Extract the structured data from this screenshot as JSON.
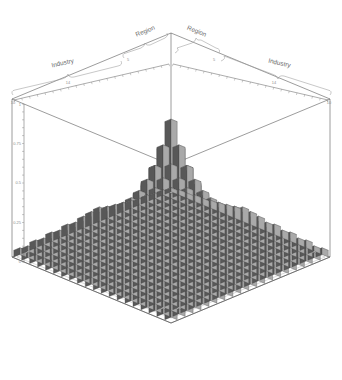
{
  "chart_data": {
    "type": "bar",
    "subtype": "3d-bar-cloud",
    "title": "",
    "xlabel": "Industry",
    "ylabel": "Region",
    "zlabel": "",
    "ylim": [
      0,
      1
    ],
    "z_ticks": [
      "0",
      "0.25",
      "0.5",
      "0.75",
      "1"
    ],
    "grid": false,
    "legend": "none",
    "projection": "isometric",
    "axes": {
      "left_front": {
        "outer_group": "Industry",
        "inner_group": "Region",
        "outer_ticks": [
          "10",
          "14"
        ],
        "inner_ticks": [
          "5"
        ]
      },
      "right_front": {
        "outer_group": "Industry",
        "inner_group": "Region",
        "outer_ticks": [
          "14",
          "10"
        ],
        "inner_ticks": [
          "5"
        ]
      }
    },
    "grid_size": {
      "rows": 20,
      "cols": 20
    },
    "peak": {
      "row": 10,
      "col": 10,
      "value": 1.0,
      "note": "central spire"
    },
    "values": [
      [
        0.05,
        0.04,
        0.07,
        0.05,
        0.09,
        0.06,
        0.12,
        0.08,
        0.1,
        0.14,
        0.18,
        0.11,
        0.09,
        0.07,
        0.12,
        0.06,
        0.05,
        0.08,
        0.04,
        0.05
      ],
      [
        0.04,
        0.06,
        0.05,
        0.08,
        0.07,
        0.11,
        0.09,
        0.14,
        0.12,
        0.17,
        0.2,
        0.13,
        0.11,
        0.09,
        0.08,
        0.07,
        0.06,
        0.05,
        0.06,
        0.04
      ],
      [
        0.07,
        0.05,
        0.09,
        0.07,
        0.12,
        0.1,
        0.15,
        0.11,
        0.16,
        0.21,
        0.24,
        0.17,
        0.14,
        0.11,
        0.1,
        0.09,
        0.07,
        0.06,
        0.05,
        0.06
      ],
      [
        0.05,
        0.08,
        0.07,
        0.11,
        0.1,
        0.14,
        0.12,
        0.18,
        0.2,
        0.25,
        0.28,
        0.21,
        0.17,
        0.14,
        0.12,
        0.1,
        0.08,
        0.07,
        0.07,
        0.05
      ],
      [
        0.09,
        0.07,
        0.12,
        0.1,
        0.15,
        0.13,
        0.19,
        0.22,
        0.26,
        0.3,
        0.34,
        0.26,
        0.21,
        0.17,
        0.14,
        0.12,
        0.1,
        0.08,
        0.06,
        0.07
      ],
      [
        0.06,
        0.11,
        0.1,
        0.14,
        0.13,
        0.18,
        0.24,
        0.27,
        0.31,
        0.36,
        0.41,
        0.32,
        0.26,
        0.2,
        0.17,
        0.14,
        0.11,
        0.09,
        0.08,
        0.06
      ],
      [
        0.12,
        0.09,
        0.15,
        0.12,
        0.19,
        0.24,
        0.29,
        0.34,
        0.39,
        0.44,
        0.5,
        0.39,
        0.31,
        0.25,
        0.2,
        0.16,
        0.13,
        0.1,
        0.09,
        0.08
      ],
      [
        0.08,
        0.14,
        0.11,
        0.18,
        0.22,
        0.27,
        0.34,
        0.41,
        0.47,
        0.53,
        0.59,
        0.47,
        0.37,
        0.29,
        0.23,
        0.18,
        0.14,
        0.12,
        0.1,
        0.07
      ],
      [
        0.1,
        0.12,
        0.16,
        0.2,
        0.26,
        0.31,
        0.39,
        0.47,
        0.55,
        0.62,
        0.69,
        0.55,
        0.43,
        0.34,
        0.27,
        0.21,
        0.16,
        0.13,
        0.11,
        0.09
      ],
      [
        0.14,
        0.17,
        0.21,
        0.25,
        0.3,
        0.36,
        0.44,
        0.53,
        0.62,
        0.72,
        0.82,
        0.65,
        0.51,
        0.4,
        0.31,
        0.24,
        0.19,
        0.15,
        0.12,
        0.1
      ],
      [
        0.18,
        0.2,
        0.24,
        0.28,
        0.34,
        0.41,
        0.5,
        0.59,
        0.69,
        0.82,
        1.0,
        0.78,
        0.6,
        0.47,
        0.36,
        0.28,
        0.22,
        0.17,
        0.14,
        0.11
      ],
      [
        0.11,
        0.13,
        0.17,
        0.21,
        0.26,
        0.32,
        0.39,
        0.47,
        0.55,
        0.65,
        0.78,
        0.61,
        0.48,
        0.38,
        0.3,
        0.23,
        0.18,
        0.14,
        0.12,
        0.09
      ],
      [
        0.09,
        0.11,
        0.14,
        0.17,
        0.21,
        0.26,
        0.31,
        0.37,
        0.43,
        0.51,
        0.6,
        0.48,
        0.38,
        0.3,
        0.24,
        0.19,
        0.15,
        0.12,
        0.1,
        0.08
      ],
      [
        0.07,
        0.09,
        0.11,
        0.14,
        0.17,
        0.2,
        0.25,
        0.29,
        0.34,
        0.4,
        0.47,
        0.38,
        0.3,
        0.24,
        0.19,
        0.15,
        0.12,
        0.1,
        0.08,
        0.07
      ],
      [
        0.12,
        0.08,
        0.1,
        0.12,
        0.14,
        0.17,
        0.2,
        0.23,
        0.27,
        0.31,
        0.36,
        0.3,
        0.24,
        0.19,
        0.16,
        0.13,
        0.1,
        0.09,
        0.07,
        0.06
      ],
      [
        0.06,
        0.07,
        0.09,
        0.1,
        0.12,
        0.14,
        0.16,
        0.18,
        0.21,
        0.24,
        0.28,
        0.23,
        0.19,
        0.15,
        0.13,
        0.11,
        0.09,
        0.07,
        0.06,
        0.05
      ],
      [
        0.05,
        0.06,
        0.07,
        0.08,
        0.1,
        0.11,
        0.13,
        0.14,
        0.16,
        0.19,
        0.22,
        0.18,
        0.15,
        0.12,
        0.1,
        0.09,
        0.07,
        0.06,
        0.05,
        0.05
      ],
      [
        0.08,
        0.05,
        0.06,
        0.07,
        0.08,
        0.09,
        0.1,
        0.12,
        0.13,
        0.15,
        0.17,
        0.14,
        0.12,
        0.1,
        0.09,
        0.07,
        0.06,
        0.05,
        0.05,
        0.04
      ],
      [
        0.04,
        0.06,
        0.05,
        0.07,
        0.06,
        0.08,
        0.09,
        0.1,
        0.11,
        0.12,
        0.14,
        0.12,
        0.1,
        0.08,
        0.07,
        0.06,
        0.05,
        0.05,
        0.04,
        0.04
      ],
      [
        0.05,
        0.04,
        0.06,
        0.05,
        0.07,
        0.06,
        0.08,
        0.07,
        0.09,
        0.1,
        0.11,
        0.09,
        0.08,
        0.07,
        0.06,
        0.05,
        0.05,
        0.04,
        0.04,
        0.03
      ]
    ]
  },
  "labels": {
    "industry_left": "Industry",
    "industry_right": "Industry",
    "region_left": "Region",
    "region_right": "Region",
    "tick_ind_left_outer": "10",
    "tick_ind_left_inner": "14",
    "tick_reg_left": "5",
    "tick_reg_right": "5",
    "tick_ind_right_inner": "14",
    "tick_ind_right_outer": "10",
    "y0": "0",
    "y25": "0.25",
    "y50": "0.5",
    "y75": "0.75",
    "y100": "1"
  },
  "colors": {
    "background": "#ffffff",
    "frame": "#4a4a4a",
    "bar_top": "#eeeeee",
    "bar_right": "#a9a9a9",
    "bar_left": "#585858",
    "bar_outline": "#3a3a3a",
    "text": "#8d8d8d",
    "brace": "#9a9a9a"
  }
}
